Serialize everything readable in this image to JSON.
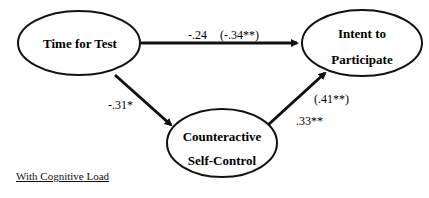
{
  "diagram": {
    "nodes": {
      "time_for_test": {
        "label": "Time for Test"
      },
      "intent": {
        "line1": "Intent to",
        "line2": "Participate"
      },
      "counteractive": {
        "line1": "Counteractive",
        "line2": "Self-Control"
      }
    },
    "paths": {
      "time_to_intent": {
        "coef": "-.24",
        "coef_alt": "(-.34**)"
      },
      "time_to_counteractive": {
        "coef": "-.31*"
      },
      "counteractive_to_intent": {
        "coef": ".33**",
        "coef_alt": "(.41**)"
      }
    },
    "caption": "With Cognitive Load"
  }
}
